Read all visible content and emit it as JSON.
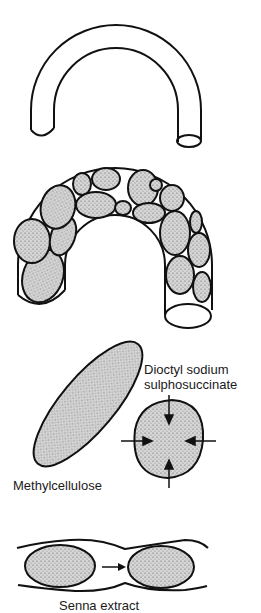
{
  "figure": {
    "panels": [
      {
        "id": "empty-colon",
        "description": "empty bent tube representing colon"
      },
      {
        "id": "bulk-filled-colon",
        "description": "tube filled with stippled faecal masses"
      },
      {
        "id": "agents",
        "labels": {
          "methylcellulose": "Methylcellulose",
          "dioctyl_line1": "Dioctyl sodium",
          "dioctyl_line2": "sulphosuccinate"
        }
      },
      {
        "id": "peristalsis",
        "labels": {
          "senna": "Senna extract"
        }
      }
    ],
    "colors": {
      "stroke": "#111111",
      "stipple": "#b8b8b8",
      "background": "#ffffff"
    }
  }
}
